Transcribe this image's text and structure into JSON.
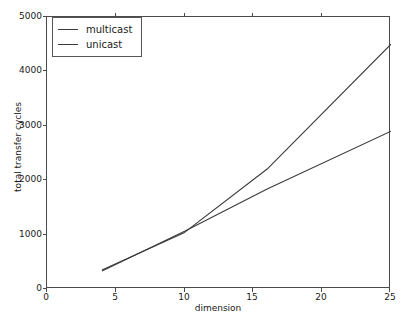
{
  "chart_data": {
    "type": "line",
    "title": "",
    "xlabel": "dimension",
    "ylabel": "total transfer cycles",
    "xlim": [
      0,
      25
    ],
    "ylim": [
      0,
      5000
    ],
    "xticks": [
      0,
      5,
      10,
      15,
      20,
      25
    ],
    "yticks": [
      0,
      1000,
      2000,
      3000,
      4000,
      5000
    ],
    "xticklabels": [
      "0",
      "5",
      "10",
      "15",
      "20",
      "25"
    ],
    "yticklabels": [
      "0",
      "1000",
      "2000",
      "3000",
      "4000",
      "5000"
    ],
    "grid": false,
    "legend_position": "upper left",
    "series": [
      {
        "name": "multicast",
        "color": "#3a3a3a",
        "x": [
          4,
          10,
          16,
          25
        ],
        "values": [
          350,
          1040,
          2205,
          4500
        ]
      },
      {
        "name": "unicast",
        "color": "#3a3a3a",
        "x": [
          4,
          10,
          16,
          25
        ],
        "values": [
          330,
          1060,
          1840,
          2900
        ]
      }
    ],
    "annotations": [
      "multicast and unicast cross near dimension 9.6 at about 1000 cycles"
    ]
  },
  "legend": {
    "entries": [
      {
        "label": "multicast"
      },
      {
        "label": "unicast"
      }
    ]
  },
  "axes": {
    "x_title": "dimension",
    "y_title": "total transfer cycles"
  },
  "colors": {
    "line": "#3a3a3a",
    "frame": "#4a4a4a",
    "background": "#ffffff",
    "text": "#1a1a1a"
  }
}
